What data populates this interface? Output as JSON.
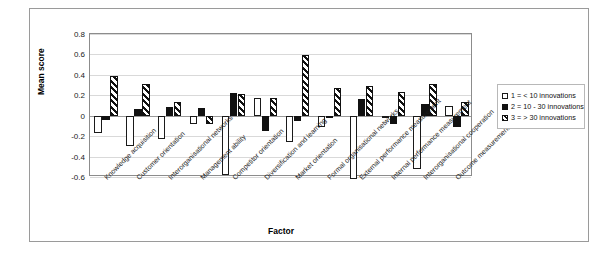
{
  "chart_data": {
    "type": "bar",
    "title": "",
    "xlabel": "Factor",
    "ylabel": "Mean score",
    "ylim": [
      -0.6,
      0.8
    ],
    "yticks": [
      "0.8",
      "0.6",
      "0.4",
      "0.2",
      "0",
      "-0.2",
      "-0.4",
      "-0.6"
    ],
    "ytick_values": [
      0.8,
      0.6,
      0.4,
      0.2,
      0,
      -0.2,
      -0.4,
      -0.6
    ],
    "grid": true,
    "legend_position": "right",
    "categories": [
      "Knowledge acquisition",
      "Customer orientation",
      "Interorganisational networks",
      "Management ability",
      "Competitor orientation",
      "Diversification and learning",
      "Market orientation",
      "Formal organisational networks",
      "External performance measurement",
      "Internal performance measurement",
      "Interorganisational cooperation",
      "Outcome measurement"
    ],
    "series": [
      {
        "name": "1 = < 10 innovations",
        "key": "s1",
        "pattern": "white-outline",
        "color": "#ffffff",
        "values": [
          -0.17,
          -0.3,
          -0.23,
          -0.08,
          -0.58,
          0.17,
          -0.26,
          -0.11,
          -0.62,
          -0.02,
          -0.52,
          0.1
        ]
      },
      {
        "name": "2 = 10 - 30 innovations",
        "key": "s2",
        "pattern": "solid-black",
        "color": "#111111",
        "values": [
          -0.04,
          0.065,
          0.09,
          0.08,
          0.22,
          -0.15,
          -0.05,
          -0.02,
          0.16,
          -0.08,
          0.11,
          -0.11
        ]
      },
      {
        "name": "3 = > 30 innovations",
        "key": "s3",
        "pattern": "diagonal-hatch",
        "color": "#111111",
        "values": [
          0.39,
          0.31,
          0.13,
          -0.08,
          0.21,
          0.17,
          0.59,
          0.27,
          0.29,
          0.23,
          0.31,
          0.13
        ]
      }
    ]
  },
  "legend": {
    "items": [
      {
        "label": "1 = < 10 innovations"
      },
      {
        "label": "2 = 10 - 30 innovations"
      },
      {
        "label": "3 = > 30 innovations"
      }
    ]
  }
}
